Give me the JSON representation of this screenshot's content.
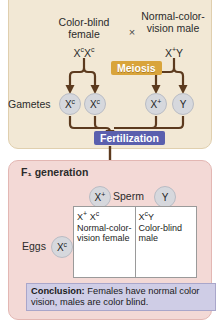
{
  "p_generation": {
    "title": "P generation",
    "parent_left": "Color-blind female",
    "parent_right": "Normal-color-vision male",
    "cross_symbol": "×",
    "genotype_left_base": "X",
    "genotype_left_sup1": "c",
    "genotype_left_base2": "X",
    "genotype_left_sup2": "c",
    "genotype_right_base": "X",
    "genotype_right_sup": "+",
    "genotype_right_y": "Y",
    "meiosis_label": "Meiosis",
    "gametes_label": "Gametes",
    "gametes": [
      {
        "base": "X",
        "sup": "c"
      },
      {
        "base": "X",
        "sup": "c"
      },
      {
        "base": "X",
        "sup": "+"
      },
      {
        "base": "Y",
        "sup": ""
      }
    ],
    "fertilization_label": "Fertilization"
  },
  "f1_generation": {
    "title": "F₁ generation",
    "sperm_label": "Sperm",
    "sperm": [
      {
        "base": "X",
        "sup": "+"
      },
      {
        "base": "Y",
        "sup": ""
      }
    ],
    "eggs_label": "Eggs",
    "eggs": [
      {
        "base": "X",
        "sup": "c"
      }
    ],
    "punnett_cells": [
      {
        "genotype_a_base": "X",
        "genotype_a_sup": "+",
        "genotype_b_base": "X",
        "genotype_b_sup": "c",
        "phenotype": "Normal-color-vision female"
      },
      {
        "genotype_a_base": "X",
        "genotype_a_sup": "c",
        "genotype_b_base": "Y",
        "genotype_b_sup": "",
        "phenotype": "Color-blind male"
      }
    ],
    "conclusion_label": "Conclusion:",
    "conclusion_text": " Females have normal color vision, males are color blind."
  },
  "colors": {
    "p_panel_bg": "#f2e8d5",
    "f1_panel_bg": "#f3d9d6",
    "meiosis_bg": "#d9a43b",
    "fertilization_bg": "#5a5fae",
    "conclusion_bg": "#cfcde6",
    "gamete_circle": "#d6d8dd",
    "arrow": "#5c3a1e"
  }
}
